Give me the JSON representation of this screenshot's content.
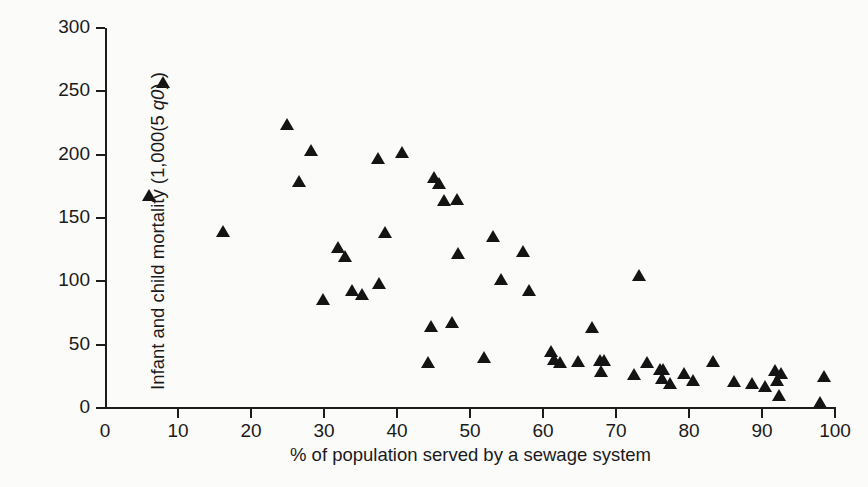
{
  "figure": {
    "background_color": "#fbfbfa",
    "ink_color": "#141414"
  },
  "chart_data": {
    "type": "scatter",
    "title": "",
    "xlabel": "% of population served by a sewage system",
    "ylabel": "Infant and child mortality (1,000(5 q0) )",
    "ylabel_parts": {
      "prefix": "Infant and child mortality (1,000(5 ",
      "italic": "q0",
      "suffix": ") )"
    },
    "xlim": [
      0,
      100
    ],
    "ylim": [
      0,
      300
    ],
    "xticks": [
      0,
      10,
      20,
      30,
      40,
      50,
      60,
      70,
      80,
      90,
      100
    ],
    "yticks": [
      0,
      50,
      100,
      150,
      200,
      250,
      300
    ],
    "xtick_labels": [
      "0",
      "10",
      "20",
      "30",
      "40",
      "50",
      "60",
      "70",
      "80",
      "90",
      "100"
    ],
    "ytick_labels": [
      "0",
      "50",
      "100",
      "150",
      "200",
      "250",
      "300"
    ],
    "grid": false,
    "legend": null,
    "marker": "triangle-up",
    "marker_color": "#141414",
    "series": [
      {
        "name": "Countries",
        "points": [
          [
            6.0,
            168
          ],
          [
            7.9,
            257
          ],
          [
            16.2,
            140
          ],
          [
            24.9,
            224
          ],
          [
            26.6,
            179
          ],
          [
            28.2,
            204
          ],
          [
            29.9,
            86
          ],
          [
            31.9,
            127
          ],
          [
            32.9,
            120
          ],
          [
            33.9,
            93
          ],
          [
            35.2,
            90
          ],
          [
            37.4,
            197
          ],
          [
            37.5,
            99
          ],
          [
            38.3,
            139
          ],
          [
            40.7,
            202
          ],
          [
            44.3,
            36
          ],
          [
            44.6,
            65
          ],
          [
            45.1,
            182
          ],
          [
            45.8,
            178
          ],
          [
            46.5,
            164
          ],
          [
            47.5,
            68
          ],
          [
            48.2,
            165
          ],
          [
            48.3,
            122
          ],
          [
            51.9,
            40
          ],
          [
            53.2,
            136
          ],
          [
            54.3,
            102
          ],
          [
            57.3,
            124
          ],
          [
            58.1,
            93
          ],
          [
            61.1,
            45
          ],
          [
            61.5,
            39
          ],
          [
            62.3,
            36
          ],
          [
            64.8,
            37
          ],
          [
            66.7,
            64
          ],
          [
            67.8,
            38
          ],
          [
            68.0,
            29
          ],
          [
            68.3,
            38
          ],
          [
            72.5,
            27
          ],
          [
            73.2,
            105
          ],
          [
            74.3,
            36
          ],
          [
            76.0,
            31
          ],
          [
            76.3,
            24
          ],
          [
            76.5,
            31
          ],
          [
            77.4,
            20
          ],
          [
            79.3,
            28
          ],
          [
            80.5,
            22
          ],
          [
            83.3,
            37
          ],
          [
            86.1,
            21
          ],
          [
            88.6,
            20
          ],
          [
            90.4,
            17
          ],
          [
            91.8,
            30
          ],
          [
            92.1,
            22
          ],
          [
            92.3,
            10
          ],
          [
            92.6,
            28
          ],
          [
            97.9,
            5
          ],
          [
            98.5,
            25
          ]
        ]
      }
    ]
  }
}
